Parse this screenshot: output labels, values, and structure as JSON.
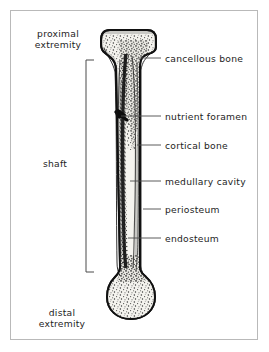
{
  "figure": {
    "frame": {
      "border_color": "#b9b9b9",
      "background": "#ffffff"
    },
    "palette": {
      "outline": "#111111",
      "cortical_bone_fill": "#c8c8c4",
      "medullary_cavity_fill": "#f2f1ec",
      "cancellous_bone_fill": "#f3f2ed",
      "speckle": "#2a2a2a",
      "leader_line": "#4a4a4a",
      "bracket": "#4a4a4a",
      "text": "#1d1d1d"
    }
  },
  "left_labels": [
    {
      "id": "proximal-extremity",
      "line1": "proximal",
      "line2": "extremity"
    },
    {
      "id": "shaft",
      "line1": "shaft",
      "line2": ""
    },
    {
      "id": "distal-extremity",
      "line1": "distal",
      "line2": "extremity"
    }
  ],
  "right_labels": [
    {
      "id": "cancellous-bone",
      "text": "cancellous bone"
    },
    {
      "id": "nutrient-foramen",
      "text": "nutrient foramen"
    },
    {
      "id": "cortical-bone",
      "text": "cortical bone"
    },
    {
      "id": "medullary-cavity",
      "text": "medullary cavity"
    },
    {
      "id": "periosteum",
      "text": "periosteum"
    },
    {
      "id": "endosteum",
      "text": "endosteum"
    }
  ]
}
